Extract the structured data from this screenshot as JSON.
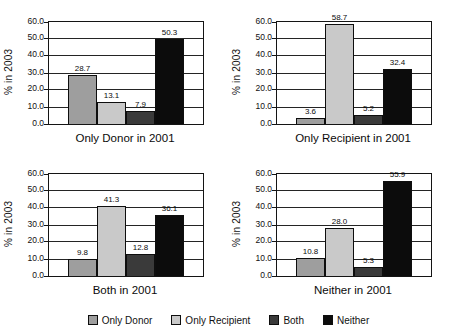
{
  "y_axis": {
    "label": "% in 2003",
    "min": 0,
    "max": 60,
    "step": 10,
    "tick_labels": [
      "60.0",
      "50.0",
      "40.0",
      "30.0",
      "20.0",
      "10.0",
      "0.0"
    ]
  },
  "legend": [
    {
      "label": "Only Donor",
      "color": "#9e9e9e"
    },
    {
      "label": "Only Recipient",
      "color": "#c9c9c9"
    },
    {
      "label": "Both",
      "color": "#3a3a3a"
    },
    {
      "label": "Neither",
      "color": "#0c0c0c"
    }
  ],
  "chart_data": [
    {
      "type": "bar",
      "title": "Only Donor in 2001",
      "categories": [
        "Only Donor",
        "Only Recipient",
        "Both",
        "Neither"
      ],
      "values": [
        28.7,
        13.1,
        7.9,
        50.3
      ],
      "xlabel": "Only Donor in 2001",
      "ylabel": "% in 2003",
      "ylim": [
        0,
        60
      ],
      "grid": "horizontal",
      "legend_position": "bottom-shared"
    },
    {
      "type": "bar",
      "title": "Only Recipient in 2001",
      "categories": [
        "Only Donor",
        "Only Recipient",
        "Both",
        "Neither"
      ],
      "values": [
        3.6,
        58.7,
        5.2,
        32.4
      ],
      "xlabel": "Only Recipient in 2001",
      "ylabel": "% in 2003",
      "ylim": [
        0,
        60
      ],
      "grid": "horizontal",
      "legend_position": "bottom-shared"
    },
    {
      "type": "bar",
      "title": "Both in 2001",
      "categories": [
        "Only Donor",
        "Only Recipient",
        "Both",
        "Neither"
      ],
      "values": [
        9.8,
        41.3,
        12.8,
        36.1
      ],
      "xlabel": "Both in 2001",
      "ylabel": "% in 2003",
      "ylim": [
        0,
        60
      ],
      "grid": "horizontal",
      "legend_position": "bottom-shared"
    },
    {
      "type": "bar",
      "title": "Neither in 2001",
      "categories": [
        "Only Donor",
        "Only Recipient",
        "Both",
        "Neither"
      ],
      "values": [
        10.8,
        28.0,
        5.3,
        55.9
      ],
      "xlabel": "Neither in 2001",
      "ylabel": "% in 2003",
      "ylim": [
        0,
        60
      ],
      "grid": "horizontal",
      "legend_position": "bottom-shared"
    }
  ]
}
